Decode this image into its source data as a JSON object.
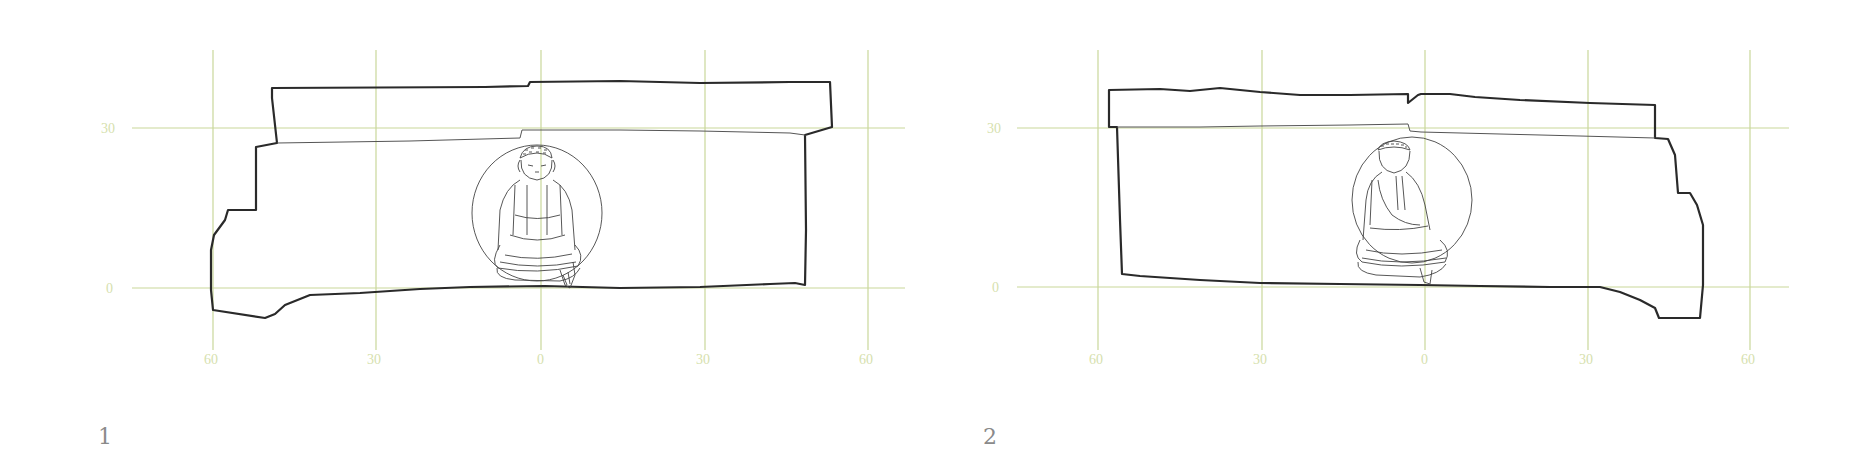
{
  "figures": [
    {
      "number": "1",
      "y_ticks": [
        "30",
        "0"
      ],
      "x_ticks": [
        "60",
        "30",
        "0",
        "30",
        "60"
      ],
      "subject": "Seated Buddha in roundel relief with mandorla (curled hair)"
    },
    {
      "number": "2",
      "y_ticks": [
        "30",
        "0"
      ],
      "x_ticks": [
        "60",
        "30",
        "0",
        "30",
        "60"
      ],
      "subject": "Seated Buddha in roundel relief with mandorla (blank face)"
    }
  ],
  "colors": {
    "grid": "#c9d79a",
    "tick_label": "#d6dfae",
    "outline": "#2a2a2a",
    "figure_number": "#8a8a8a"
  }
}
